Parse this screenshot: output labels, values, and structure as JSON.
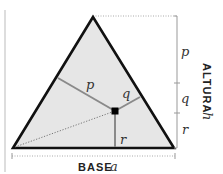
{
  "diagram": {
    "type": "triangle-altitude-proof",
    "colors": {
      "fill": "#e6e6e6",
      "outline": "#111111",
      "perpendiculars": "#8a8a8a",
      "scale": "#999999",
      "point": "#000000"
    },
    "triangle": {
      "apex": [
        93,
        17
      ],
      "bottom_left": [
        13,
        148
      ],
      "bottom_right": [
        174,
        148
      ]
    },
    "point": [
      115,
      111
    ],
    "segments": {
      "p": {
        "label": "p",
        "to": [
          58,
          78
        ]
      },
      "q": {
        "label": "q",
        "to": [
          140,
          97
        ]
      },
      "r": {
        "label": "r",
        "to": [
          115,
          148
        ]
      }
    },
    "height_scale": {
      "title": "ALTURA",
      "variable": "h",
      "parts": [
        {
          "label": "p"
        },
        {
          "label": "q"
        },
        {
          "label": "r"
        }
      ]
    },
    "base_scale": {
      "title": "BASE",
      "variable": "a"
    }
  }
}
